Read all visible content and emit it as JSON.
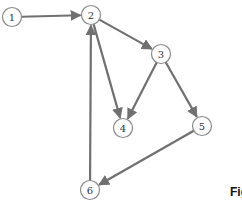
{
  "diagram": {
    "type": "directed-graph",
    "nodes": [
      {
        "id": "1",
        "label": "1",
        "x": 12,
        "y": 17
      },
      {
        "id": "2",
        "label": "2",
        "x": 91,
        "y": 15
      },
      {
        "id": "3",
        "label": "3",
        "x": 161,
        "y": 54
      },
      {
        "id": "4",
        "label": "4",
        "x": 123,
        "y": 128
      },
      {
        "id": "5",
        "label": "5",
        "x": 202,
        "y": 126
      },
      {
        "id": "6",
        "label": "6",
        "x": 90,
        "y": 190
      }
    ],
    "edges": [
      {
        "from": "1",
        "to": "2"
      },
      {
        "from": "2",
        "to": "3"
      },
      {
        "from": "2",
        "to": "4"
      },
      {
        "from": "3",
        "to": "4"
      },
      {
        "from": "3",
        "to": "5"
      },
      {
        "from": "5",
        "to": "6"
      },
      {
        "from": "6",
        "to": "2"
      }
    ],
    "node_radius": 9.5,
    "edge_color": "#707070",
    "node_stroke_color": "#8a8a8a"
  },
  "caption": {
    "text": "Fig"
  }
}
